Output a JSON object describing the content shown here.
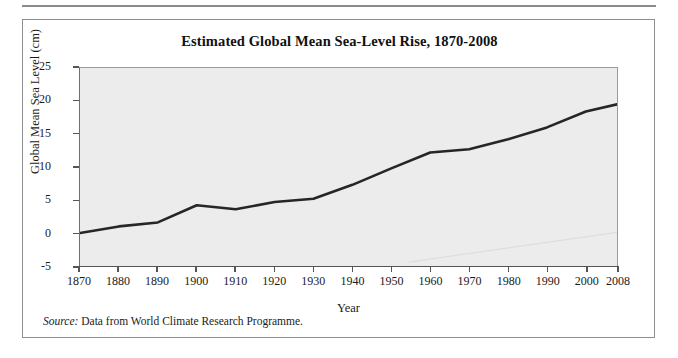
{
  "figure": {
    "title": "Estimated Global Mean Sea-Level Rise, 1870-2008",
    "source_label": "Source:",
    "source_text": " Data from World Climate Research Programme."
  },
  "chart_data": {
    "type": "line",
    "title": "Estimated Global Mean Sea-Level Rise, 1870-2008",
    "xlabel": "Year",
    "ylabel": "Global Mean Sea Level (cm)",
    "xlim": [
      1870,
      2008
    ],
    "ylim": [
      -5,
      25
    ],
    "ytick_labels": [
      "25",
      "20",
      "15",
      "10",
      "5",
      "0",
      "-5"
    ],
    "ytick_values": [
      25,
      20,
      15,
      10,
      5,
      0,
      -5
    ],
    "xtick_labels": [
      "1870",
      "1880",
      "1890",
      "1900",
      "1910",
      "1920",
      "1930",
      "1940",
      "1950",
      "1960",
      "1970",
      "1980",
      "1990",
      "2000",
      "2008"
    ],
    "xtick_values": [
      1870,
      1880,
      1890,
      1900,
      1910,
      1920,
      1930,
      1940,
      1950,
      1960,
      1970,
      1980,
      1990,
      2000,
      2008
    ],
    "grid": false,
    "legend": null,
    "line_color": "#262626",
    "plot_background": "#ececec",
    "series": [
      {
        "name": "Global Mean Sea Level",
        "x": [
          1870,
          1880,
          1890,
          1900,
          1910,
          1920,
          1930,
          1940,
          1950,
          1960,
          1970,
          1980,
          1990,
          2000,
          2008
        ],
        "values": [
          0.0,
          1.0,
          1.6,
          4.2,
          3.6,
          4.7,
          5.2,
          7.3,
          9.8,
          12.2,
          12.7,
          14.2,
          16.0,
          18.4,
          19.5
        ]
      }
    ]
  },
  "axis": {
    "y_title": "Global Mean Sea Level (cm)",
    "x_title": "Year"
  }
}
